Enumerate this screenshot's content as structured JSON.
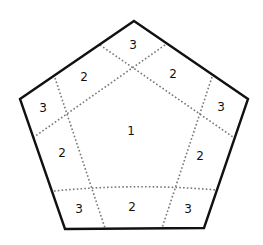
{
  "diagram": {
    "shape": "pentagon",
    "colors": {
      "outline": "#111111",
      "dotted": "#777777",
      "text": "#111111"
    },
    "regions": [
      {
        "id": "center",
        "label": "1"
      },
      {
        "id": "top-corner",
        "label": "3"
      },
      {
        "id": "upper-left-edge",
        "label": "2"
      },
      {
        "id": "upper-right-edge",
        "label": "2"
      },
      {
        "id": "left-corner",
        "label": "3"
      },
      {
        "id": "right-corner",
        "label": "3"
      },
      {
        "id": "lower-left-edge",
        "label": "2"
      },
      {
        "id": "lower-right-edge",
        "label": "2"
      },
      {
        "id": "bottom-left-corner",
        "label": "3"
      },
      {
        "id": "bottom-edge",
        "label": "2"
      },
      {
        "id": "bottom-right-corner",
        "label": "3"
      }
    ]
  }
}
